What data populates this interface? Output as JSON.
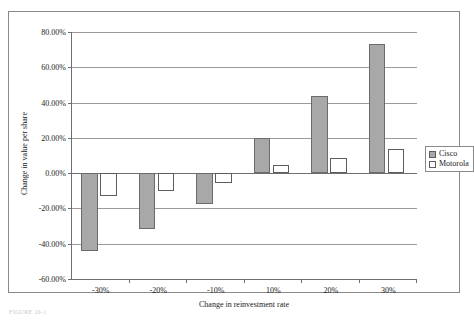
{
  "figure": {
    "caption": "FIGURE 10-1"
  },
  "legend": {
    "position": "right",
    "entries": [
      {
        "label": "Cisco",
        "swatch": "cisco"
      },
      {
        "label": "Motorola",
        "swatch": "motorola"
      }
    ]
  },
  "chart_data": {
    "type": "bar",
    "title": "",
    "subtitle": "",
    "xlabel": "Change in reinvestment rate",
    "ylabel": "Change in value per share",
    "categories": [
      "-30%",
      "-20%",
      "-10%",
      "10%",
      "20%",
      "30%"
    ],
    "series": [
      {
        "name": "Cisco",
        "values": [
          -44.0,
          -31.5,
          -17.5,
          20.0,
          44.0,
          73.0
        ],
        "color": "#a8a8a8"
      },
      {
        "name": "Motorola",
        "values": [
          -13.0,
          -10.0,
          -5.5,
          4.5,
          8.5,
          13.5
        ],
        "color": "#ffffff"
      }
    ],
    "ylim": [
      -60,
      80
    ],
    "ytick_values": [
      80,
      60,
      40,
      20,
      0,
      -20,
      -40,
      -60
    ],
    "ytick_labels": [
      "80.00%",
      "60.00%",
      "40.00%",
      "20.00%",
      "0.00%",
      "-20.00%",
      "-40.00%",
      "-60.00%"
    ],
    "ytick_suffix": "%",
    "grid": true,
    "legend_position": "right",
    "value_format": "percent-2dp"
  }
}
